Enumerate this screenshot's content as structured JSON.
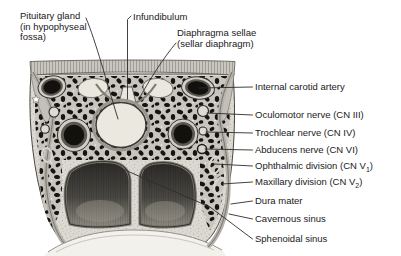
{
  "figure": {
    "background_color": "#ffffff",
    "ink_color": "#1a1a1a",
    "asterisk_marker": "*"
  },
  "top_labels": {
    "pituitary": {
      "line1": "Pituitary gland",
      "line2": "(in hypophyseal",
      "line3": "fossa)"
    },
    "infundibulum": {
      "label": "Infundibulum"
    },
    "diaphragma": {
      "line1": "Diaphragma sellae",
      "line2": "(sellar diaphragm)"
    }
  },
  "right_labels": [
    {
      "label": "Internal carotid artery"
    },
    {
      "label": "Oculomotor nerve (CN III)"
    },
    {
      "label": "Trochlear nerve (CN IV)"
    },
    {
      "label": "Abducens nerve (CN VI)"
    },
    {
      "label": "Ophthalmic division (CN V",
      "sub": "1",
      "suffix": ")"
    },
    {
      "label": "Maxillary division (CN V",
      "sub": "2",
      "suffix": ")"
    },
    {
      "label": "Dura mater"
    },
    {
      "label": "Cavernous sinus"
    },
    {
      "label": "Sphenoidal sinus"
    }
  ]
}
